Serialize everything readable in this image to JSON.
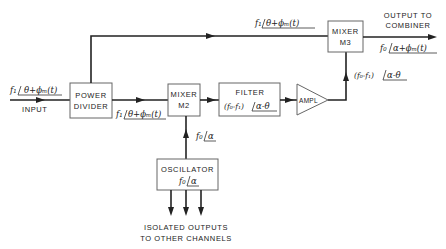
{
  "diagram": {
    "type": "block-diagram",
    "blocks": {
      "power_divider": {
        "line1": "POWER",
        "line2": "DIVIDER"
      },
      "mixer_m2": {
        "line1": "MIXER",
        "line2": "M2"
      },
      "filter": {
        "line1": "FILTER",
        "sig_prefix": "(f₀-f₁)",
        "sig_angle": "α-θ"
      },
      "amplifier": {
        "label": "AMPL"
      },
      "mixer_m3": {
        "line1": "MIXER",
        "line2": "M3"
      },
      "oscillator": {
        "line1": "OSCILLATOR",
        "sig_prefix": "f₀",
        "sig_angle": "α"
      }
    },
    "labels": {
      "input": "INPUT",
      "input_sig_prefix": "f₁",
      "input_sig_angle": "θ+ϕₘ(t)",
      "top_sig_prefix": "f₁",
      "top_sig_angle": "θ+ϕₘ(t)",
      "pd_m2_sig_prefix": "f₁",
      "pd_m2_sig_angle": "θ+ϕₘ(t)",
      "osc_m2_sig_prefix": "f₀",
      "osc_m2_sig_angle": "α",
      "amp_m3_sig_prefix": "(f₀-f₁)",
      "amp_m3_sig_angle": "α-θ",
      "output_line1": "OUTPUT TO",
      "output_line2": "COMBINER",
      "output_sig_prefix": "f₀",
      "output_sig_angle": "α+ϕₘ(t)",
      "isolated_line1": "ISOLATED OUTPUTS",
      "isolated_line2": "TO OTHER CHANNELS"
    }
  }
}
